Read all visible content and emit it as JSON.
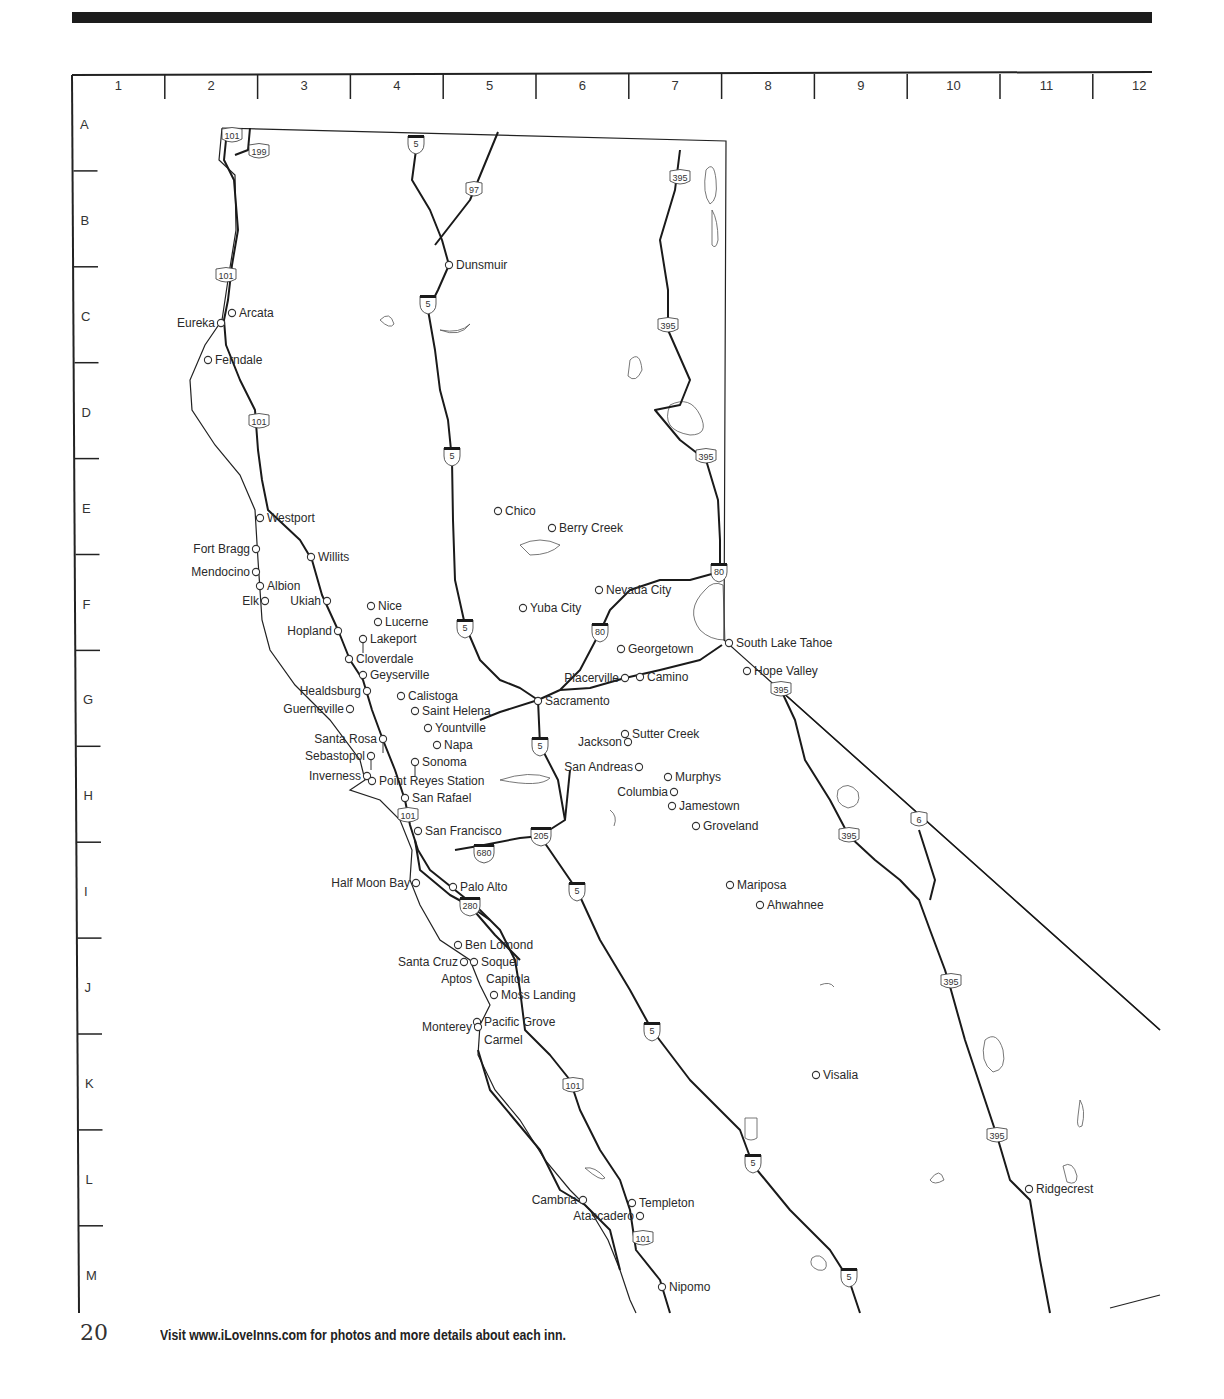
{
  "page": {
    "page_number": "20",
    "footer_text": "Visit www.iLoveInns.com for photos and more details about each inn."
  },
  "grid": {
    "columns": [
      "1",
      "2",
      "3",
      "4",
      "5",
      "6",
      "7",
      "8",
      "9",
      "10",
      "11",
      "12"
    ],
    "rows": [
      "A",
      "B",
      "C",
      "D",
      "E",
      "F",
      "G",
      "H",
      "I",
      "J",
      "K",
      "L",
      "M"
    ]
  },
  "highways": [
    {
      "label": "101",
      "type": "us",
      "x": 232,
      "y": 136
    },
    {
      "label": "199",
      "type": "us",
      "x": 259,
      "y": 152
    },
    {
      "label": "5",
      "type": "interstate",
      "x": 416,
      "y": 144
    },
    {
      "label": "97",
      "type": "us",
      "x": 474,
      "y": 190
    },
    {
      "label": "395",
      "type": "us",
      "x": 680,
      "y": 178
    },
    {
      "label": "101",
      "type": "us",
      "x": 226,
      "y": 276
    },
    {
      "label": "5",
      "type": "interstate",
      "x": 428,
      "y": 304
    },
    {
      "label": "395",
      "type": "us",
      "x": 668,
      "y": 326
    },
    {
      "label": "101",
      "type": "us",
      "x": 259,
      "y": 422
    },
    {
      "label": "5",
      "type": "interstate",
      "x": 452,
      "y": 456
    },
    {
      "label": "395",
      "type": "us",
      "x": 706,
      "y": 457
    },
    {
      "label": "80",
      "type": "interstate",
      "x": 719,
      "y": 572
    },
    {
      "label": "5",
      "type": "interstate",
      "x": 465,
      "y": 628
    },
    {
      "label": "80",
      "type": "interstate",
      "x": 600,
      "y": 632
    },
    {
      "label": "395",
      "type": "us",
      "x": 781,
      "y": 690
    },
    {
      "label": "5",
      "type": "interstate",
      "x": 540,
      "y": 746
    },
    {
      "label": "101",
      "type": "us",
      "x": 408,
      "y": 816
    },
    {
      "label": "205",
      "type": "interstate",
      "x": 541,
      "y": 836
    },
    {
      "label": "680",
      "type": "interstate",
      "x": 484,
      "y": 853
    },
    {
      "label": "395",
      "type": "us",
      "x": 849,
      "y": 836
    },
    {
      "label": "6",
      "type": "us",
      "x": 919,
      "y": 820
    },
    {
      "label": "5",
      "type": "interstate",
      "x": 577,
      "y": 891
    },
    {
      "label": "280",
      "type": "interstate",
      "x": 470,
      "y": 906
    },
    {
      "label": "395",
      "type": "us",
      "x": 951,
      "y": 982
    },
    {
      "label": "5",
      "type": "interstate",
      "x": 652,
      "y": 1031
    },
    {
      "label": "101",
      "type": "us",
      "x": 573,
      "y": 1086
    },
    {
      "label": "395",
      "type": "us",
      "x": 997,
      "y": 1136
    },
    {
      "label": "5",
      "type": "interstate",
      "x": 753,
      "y": 1163
    },
    {
      "label": "101",
      "type": "us",
      "x": 643,
      "y": 1239
    },
    {
      "label": "5",
      "type": "interstate",
      "x": 849,
      "y": 1277
    }
  ],
  "cities": [
    {
      "name": "Dunsmuir",
      "x": 449,
      "y": 265,
      "side": "right"
    },
    {
      "name": "Arcata",
      "x": 232,
      "y": 313,
      "side": "right"
    },
    {
      "name": "Eureka",
      "x": 221,
      "y": 323,
      "side": "left"
    },
    {
      "name": "Ferndale",
      "x": 208,
      "y": 360,
      "side": "right"
    },
    {
      "name": "Westport",
      "x": 260,
      "y": 518,
      "side": "right"
    },
    {
      "name": "Chico",
      "x": 498,
      "y": 511,
      "side": "right"
    },
    {
      "name": "Berry Creek",
      "x": 552,
      "y": 528,
      "side": "right"
    },
    {
      "name": "Fort Bragg",
      "x": 256,
      "y": 549,
      "side": "left"
    },
    {
      "name": "Willits",
      "x": 311,
      "y": 557,
      "side": "right"
    },
    {
      "name": "Mendocino",
      "x": 256,
      "y": 572,
      "side": "left"
    },
    {
      "name": "Albion",
      "x": 260,
      "y": 586,
      "side": "right"
    },
    {
      "name": "Nevada City",
      "x": 599,
      "y": 590,
      "side": "right"
    },
    {
      "name": "Elk",
      "x": 265,
      "y": 601,
      "side": "left"
    },
    {
      "name": "Ukiah",
      "x": 327,
      "y": 601,
      "side": "left"
    },
    {
      "name": "Nice",
      "x": 371,
      "y": 606,
      "side": "right"
    },
    {
      "name": "Yuba City",
      "x": 523,
      "y": 608,
      "side": "right"
    },
    {
      "name": "Lucerne",
      "x": 378,
      "y": 622,
      "side": "right"
    },
    {
      "name": "Hopland",
      "x": 338,
      "y": 631,
      "side": "left"
    },
    {
      "name": "Lakeport",
      "x": 363,
      "y": 639,
      "side": "right",
      "stem": true
    },
    {
      "name": "South Lake Tahoe",
      "x": 729,
      "y": 643,
      "side": "right"
    },
    {
      "name": "Georgetown",
      "x": 621,
      "y": 649,
      "side": "right"
    },
    {
      "name": "Cloverdale",
      "x": 349,
      "y": 659,
      "side": "right"
    },
    {
      "name": "Hope Valley",
      "x": 747,
      "y": 671,
      "side": "right"
    },
    {
      "name": "Geyserville",
      "x": 363,
      "y": 675,
      "side": "right"
    },
    {
      "name": "Placerville",
      "x": 625,
      "y": 678,
      "side": "left"
    },
    {
      "name": "Camino",
      "x": 640,
      "y": 677,
      "side": "right"
    },
    {
      "name": "Healdsburg",
      "x": 367,
      "y": 691,
      "side": "left"
    },
    {
      "name": "Calistoga",
      "x": 401,
      "y": 696,
      "side": "right"
    },
    {
      "name": "Sacramento",
      "x": 538,
      "y": 701,
      "side": "right"
    },
    {
      "name": "Guerneville",
      "x": 350,
      "y": 709,
      "side": "left"
    },
    {
      "name": "Saint Helena",
      "x": 415,
      "y": 711,
      "side": "right"
    },
    {
      "name": "Yountville",
      "x": 428,
      "y": 728,
      "side": "right"
    },
    {
      "name": "Santa Rosa",
      "x": 383,
      "y": 739,
      "side": "left",
      "stem": true
    },
    {
      "name": "Sutter Creek",
      "x": 625,
      "y": 734,
      "side": "right"
    },
    {
      "name": "Jackson",
      "x": 628,
      "y": 742,
      "side": "left"
    },
    {
      "name": "Napa",
      "x": 437,
      "y": 745,
      "side": "right"
    },
    {
      "name": "Sebastopol",
      "x": 371,
      "y": 756,
      "side": "left",
      "stem": true
    },
    {
      "name": "Sonoma",
      "x": 415,
      "y": 762,
      "side": "right",
      "stem": true
    },
    {
      "name": "San Andreas",
      "x": 639,
      "y": 767,
      "side": "left"
    },
    {
      "name": "Inverness",
      "x": 367,
      "y": 776,
      "side": "left"
    },
    {
      "name": "Murphys",
      "x": 668,
      "y": 777,
      "side": "right"
    },
    {
      "name": "Point Reyes Station",
      "x": 372,
      "y": 781,
      "side": "right"
    },
    {
      "name": "Columbia",
      "x": 674,
      "y": 792,
      "side": "left"
    },
    {
      "name": "San Rafael",
      "x": 405,
      "y": 798,
      "side": "right"
    },
    {
      "name": "Jamestown",
      "x": 672,
      "y": 806,
      "side": "right"
    },
    {
      "name": "Groveland",
      "x": 696,
      "y": 826,
      "side": "right"
    },
    {
      "name": "San Francisco",
      "x": 418,
      "y": 831,
      "side": "right"
    },
    {
      "name": "Half Moon Bay",
      "x": 416,
      "y": 883,
      "side": "left"
    },
    {
      "name": "Mariposa",
      "x": 730,
      "y": 885,
      "side": "right"
    },
    {
      "name": "Palo Alto",
      "x": 453,
      "y": 887,
      "side": "right"
    },
    {
      "name": "Ahwahnee",
      "x": 760,
      "y": 905,
      "side": "right"
    },
    {
      "name": "Ben Lomond",
      "x": 458,
      "y": 945,
      "side": "right"
    },
    {
      "name": "Soquel",
      "x": 474,
      "y": 962,
      "side": "right"
    },
    {
      "name": "Santa Cruz",
      "x": 464,
      "y": 962,
      "side": "left"
    },
    {
      "name": "Aptos",
      "x": 478,
      "y": 979,
      "side": "left",
      "nomarker": true
    },
    {
      "name": "Capitola",
      "x": 479,
      "y": 979,
      "side": "right",
      "nomarker": true
    },
    {
      "name": "Moss Landing",
      "x": 494,
      "y": 995,
      "side": "right"
    },
    {
      "name": "Pacific Grove",
      "x": 477,
      "y": 1022,
      "side": "right"
    },
    {
      "name": "Monterey",
      "x": 478,
      "y": 1027,
      "side": "left"
    },
    {
      "name": "Carmel",
      "x": 477,
      "y": 1040,
      "side": "right",
      "nomarker": true
    },
    {
      "name": "Visalia",
      "x": 816,
      "y": 1075,
      "side": "right"
    },
    {
      "name": "Ridgecrest",
      "x": 1029,
      "y": 1189,
      "side": "right"
    },
    {
      "name": "Cambria",
      "x": 583,
      "y": 1200,
      "side": "left"
    },
    {
      "name": "Templeton",
      "x": 632,
      "y": 1203,
      "side": "right"
    },
    {
      "name": "Atascadero",
      "x": 640,
      "y": 1216,
      "side": "left"
    },
    {
      "name": "Nipomo",
      "x": 662,
      "y": 1287,
      "side": "right"
    }
  ]
}
